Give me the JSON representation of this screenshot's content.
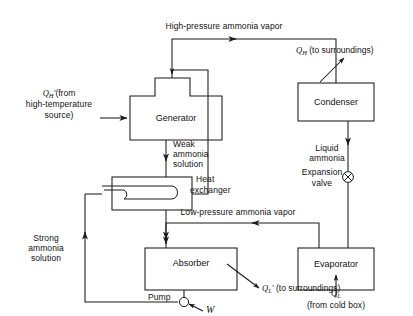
{
  "figure": {
    "type": "process-flow-diagram",
    "background_color": "#ffffff",
    "line_color": "#1a1a1a",
    "text_color": "#111111"
  },
  "components": [
    {
      "id": "generator",
      "label": "Generator",
      "x": 130,
      "y": 96,
      "w": 92,
      "h": 44
    },
    {
      "id": "heat_exchanger",
      "label": "Heat\nexchanger",
      "x": 112,
      "y": 177,
      "w": 80,
      "h": 33
    },
    {
      "id": "absorber",
      "label": "Absorber",
      "x": 145,
      "y": 248,
      "w": 92,
      "h": 42
    },
    {
      "id": "condenser",
      "label": "Condenser",
      "x": 336,
      "y": 83,
      "w": 76,
      "h": 38
    },
    {
      "id": "evaporator",
      "label": "Evaporator",
      "x": 336,
      "y": 248,
      "w": 76,
      "h": 42
    },
    {
      "id": "pump",
      "label": "Pump",
      "x": 127,
      "y": 289
    },
    {
      "id": "expansion_valve",
      "label": "Expansion\nvalve",
      "x": 348,
      "y": 177
    }
  ],
  "labels": {
    "generator": "Generator",
    "condenser": "Condenser",
    "absorber": "Absorber",
    "evaporator": "Evaporator",
    "heat_exchanger_line1": "Heat",
    "heat_exchanger_line2": "exchanger",
    "pump": "Pump",
    "expansion_valve_line1": "Expansion",
    "expansion_valve_line2": "valve"
  },
  "streams": {
    "high_pressure_vapor": "High-pressure ammonia vapor",
    "low_pressure_vapor": "Low-pressure ammonia vapor",
    "weak_solution_line1": "Weak",
    "weak_solution_line2": "ammonia",
    "weak_solution_line3": "solution",
    "strong_solution_line1": "Strong",
    "strong_solution_line2": "ammonia",
    "strong_solution_line3": "solution",
    "liquid_ammonia_line1": "Liquid",
    "liquid_ammonia_line2": "ammonia"
  },
  "energy": {
    "qh_in_symbol": "Q",
    "qh_in_sub": "H",
    "qh_in_prime": "′",
    "qh_in_text_line1": "(from",
    "qh_in_text_line2": "high-temperature",
    "qh_in_text_line3": "source)",
    "qh_out_symbol": "Q",
    "qh_out_sub": "H",
    "qh_out_text": "(to surroundings)",
    "ql_out_symbol": "Q",
    "ql_out_sub": "L",
    "ql_out_prime": "′",
    "ql_out_text": "(to surroundings)",
    "ql_in_symbol": "Q",
    "ql_in_sub": "L",
    "ql_in_text": "(from cold box)",
    "work_symbol": "W"
  }
}
